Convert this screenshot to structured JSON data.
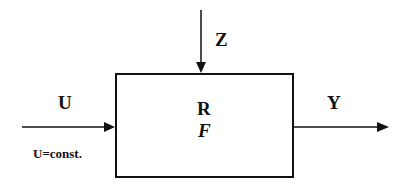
{
  "diagram": {
    "type": "block-diagram",
    "block": {
      "label_top": "R",
      "label_bottom": "F"
    },
    "inputs": [
      {
        "id": "disturbance",
        "label": "Z",
        "direction": "top"
      },
      {
        "id": "input",
        "label": "U",
        "direction": "left",
        "note": "U=const."
      }
    ],
    "outputs": [
      {
        "id": "output",
        "label": "Y",
        "direction": "right"
      }
    ],
    "colors": {
      "stroke": "#111111",
      "background": "#ffffff"
    }
  }
}
